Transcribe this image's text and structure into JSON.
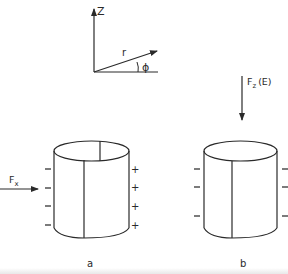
{
  "figure": {
    "coordinate_system": {
      "axis_z_label": "Z",
      "radius_label": "r",
      "angle_label": "ϕ"
    },
    "force_z": {
      "label_main": "F",
      "label_sub": "z",
      "label_suffix": "(E)"
    },
    "force_x": {
      "label_main": "F",
      "label_sub": "x"
    },
    "cylinder_a": {
      "label": "a",
      "left_charges": [
        "−",
        "−",
        "−",
        "−"
      ],
      "right_charges": [
        "+",
        "+",
        "+",
        "+"
      ]
    },
    "cylinder_b": {
      "label": "b",
      "left_charges": [
        "−",
        "−",
        "−"
      ],
      "right_charges": [
        "−",
        "−",
        "−"
      ]
    }
  }
}
